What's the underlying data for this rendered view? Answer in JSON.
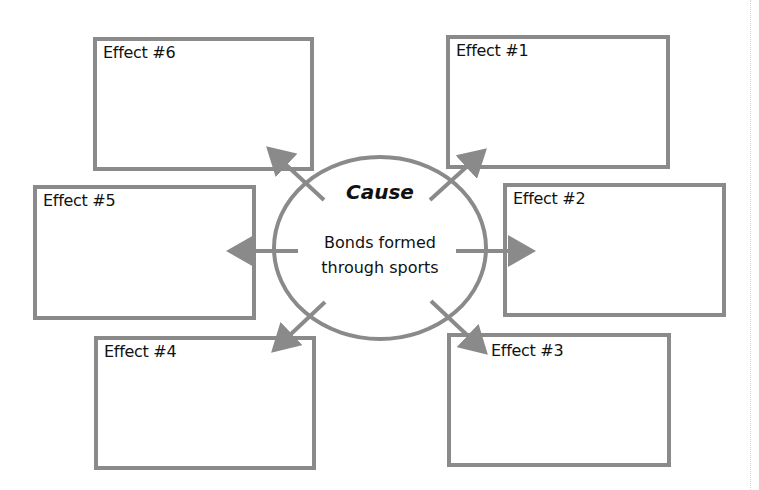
{
  "diagram": {
    "type": "cause-and-effect organizer",
    "colors": {
      "stroke": "#8a8a8a",
      "text": "#111111",
      "background": "#ffffff"
    },
    "cause": {
      "title": "Cause",
      "text_line1": "Bonds formed",
      "text_line2": "through sports"
    },
    "effects": [
      {
        "id": 1,
        "label": "Effect #1",
        "content": ""
      },
      {
        "id": 2,
        "label": "Effect #2",
        "content": ""
      },
      {
        "id": 3,
        "label": "Effect #3",
        "content": ""
      },
      {
        "id": 4,
        "label": "Effect #4",
        "content": ""
      },
      {
        "id": 5,
        "label": "Effect #5",
        "content": ""
      },
      {
        "id": 6,
        "label": "Effect #6",
        "content": ""
      }
    ]
  }
}
